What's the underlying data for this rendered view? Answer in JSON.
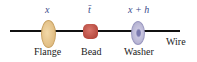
{
  "diagram": {
    "positions": [
      {
        "symbol": "x",
        "object": "Flange"
      },
      {
        "symbol": "t̄",
        "object": "Bead"
      },
      {
        "symbol": "x + h",
        "object": "Washer"
      }
    ],
    "wire_label": "Wire",
    "colors": {
      "flange": "#e6c48e",
      "bead": "#c0504a",
      "washer": "#b8b6d6",
      "wire": "#111111",
      "symbols": "#3a4a8a"
    }
  }
}
